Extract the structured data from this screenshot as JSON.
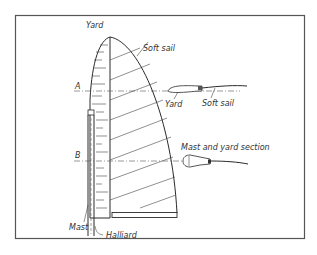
{
  "diagram": {
    "type": "technical-drawing",
    "labels": {
      "yard_top": "Yard",
      "soft_sail_top": "Soft sail",
      "section_a": "A",
      "section_b": "B",
      "yard_section": "Yard",
      "soft_sail_section": "Soft sail",
      "mast_yard_section": "Mast and yard section",
      "mast": "Mast",
      "halliard": "Halliard"
    },
    "colors": {
      "line": "#2a2a2a",
      "background": "#ffffff",
      "frame": "#555555"
    }
  }
}
